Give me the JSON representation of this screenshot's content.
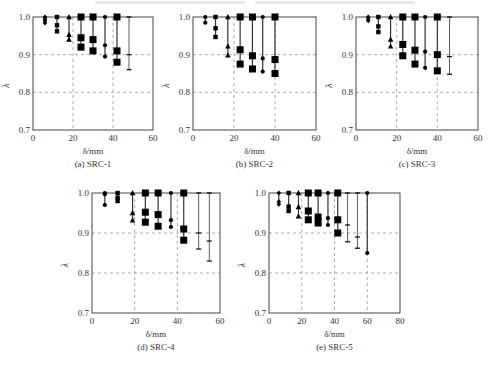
{
  "figure": {
    "top_caption_cut_off": true
  },
  "chart_data": [
    {
      "id": "a",
      "type": "scatter",
      "caption": "(a) SRC-1",
      "xlabel": "δ/mm",
      "ylabel": "λ",
      "xlim": [
        0,
        60
      ],
      "ylim": [
        0.7,
        1.0
      ],
      "xticks": [
        "0",
        "20",
        "40",
        "60"
      ],
      "yticks": [
        "0.7",
        "0.8",
        "0.9",
        "1.0"
      ],
      "grid": "dashed at x=20,40 and y=0.8,0.9",
      "box": {
        "left": 33,
        "top": 17,
        "right": 153,
        "bottom": 130
      },
      "groups": [
        {
          "x": 6,
          "marker": "diamond",
          "values": [
            1.0,
            0.995,
            0.99,
            0.984
          ]
        },
        {
          "x": 12,
          "marker": "small-square",
          "values": [
            1.0,
            0.978,
            0.962
          ]
        },
        {
          "x": 18,
          "marker": "triangle",
          "values": [
            1.0,
            0.953,
            0.94
          ]
        },
        {
          "x": 24,
          "marker": "big-square",
          "values": [
            1.0,
            0.945,
            0.92
          ]
        },
        {
          "x": 30,
          "marker": "big-square",
          "values": [
            1.0,
            0.94,
            0.91
          ]
        },
        {
          "x": 36,
          "marker": "circle",
          "values": [
            1.0,
            0.925,
            0.895
          ]
        },
        {
          "x": 42,
          "marker": "big-square",
          "values": [
            1.0,
            0.91,
            0.88
          ]
        },
        {
          "x": 48,
          "marker": "dash",
          "values": [
            1.0,
            0.9,
            0.86
          ]
        }
      ]
    },
    {
      "id": "b",
      "type": "scatter",
      "caption": "(b) SRC-2",
      "xlabel": "δ/mm",
      "ylabel": "λ",
      "xlim": [
        0,
        60
      ],
      "ylim": [
        0.7,
        1.0
      ],
      "xticks": [
        "0",
        "20",
        "40",
        "60"
      ],
      "yticks": [
        "0.7",
        "0.8",
        "0.9",
        "1.0"
      ],
      "grid": "dashed at x=20,40 and y=0.8,0.9",
      "box": {
        "left": 193,
        "top": 17,
        "right": 316,
        "bottom": 130
      },
      "groups": [
        {
          "x": 6,
          "marker": "circle",
          "values": [
            1.0,
            0.985
          ]
        },
        {
          "x": 11,
          "marker": "small-square",
          "values": [
            1.0,
            0.97,
            0.947
          ]
        },
        {
          "x": 17,
          "marker": "triangle",
          "values": [
            1.0,
            0.922,
            0.898
          ]
        },
        {
          "x": 23,
          "marker": "big-square",
          "values": [
            1.0,
            0.913,
            0.875
          ]
        },
        {
          "x": 29,
          "marker": "big-square",
          "values": [
            1.0,
            0.897,
            0.862
          ]
        },
        {
          "x": 34,
          "marker": "circle",
          "values": [
            1.0,
            0.89,
            0.855
          ]
        },
        {
          "x": 40,
          "marker": "big-square",
          "values": [
            1.0,
            0.887,
            0.85
          ]
        }
      ]
    },
    {
      "id": "c",
      "type": "scatter",
      "caption": "(c) SRC-3",
      "xlabel": "δ/mm",
      "ylabel": "λ",
      "xlim": [
        0,
        60
      ],
      "ylim": [
        0.7,
        1.0
      ],
      "xticks": [
        "0",
        "20",
        "40",
        "60"
      ],
      "yticks": [
        "0.7",
        "0.8",
        "0.9",
        "1.0"
      ],
      "grid": "dashed at x=20,40 and y=0.8,0.9",
      "box": {
        "left": 356,
        "top": 17,
        "right": 478,
        "bottom": 130
      },
      "groups": [
        {
          "x": 6,
          "marker": "diamond",
          "values": [
            1.0,
            0.995,
            0.99
          ]
        },
        {
          "x": 11,
          "marker": "small-square",
          "values": [
            1.0,
            0.975,
            0.96
          ]
        },
        {
          "x": 17,
          "marker": "triangle",
          "values": [
            1.0,
            0.94,
            0.922
          ]
        },
        {
          "x": 23,
          "marker": "big-square",
          "values": [
            1.0,
            0.927,
            0.897
          ]
        },
        {
          "x": 29,
          "marker": "big-square",
          "values": [
            1.0,
            0.912,
            0.875
          ]
        },
        {
          "x": 34,
          "marker": "circle",
          "values": [
            1.0,
            0.908,
            0.865
          ]
        },
        {
          "x": 40,
          "marker": "big-square",
          "values": [
            1.0,
            0.9,
            0.857
          ]
        },
        {
          "x": 46,
          "marker": "dash",
          "values": [
            1.0,
            0.895,
            0.848
          ]
        }
      ]
    },
    {
      "id": "d",
      "type": "scatter",
      "caption": "(d) SRC-4",
      "xlabel": "δ/mm",
      "ylabel": "λ",
      "xlim": [
        0,
        60
      ],
      "ylim": [
        0.7,
        1.0
      ],
      "xticks": [
        "0",
        "20",
        "40",
        "60"
      ],
      "yticks": [
        "0.7",
        "0.8",
        "0.9",
        "1.0"
      ],
      "grid": "dashed at x=20,40 and y=0.8,0.9",
      "box": {
        "left": 92,
        "top": 193,
        "right": 220,
        "bottom": 313
      },
      "groups": [
        {
          "x": 6,
          "marker": "circle",
          "values": [
            1.0,
            0.997,
            0.97
          ]
        },
        {
          "x": 12,
          "marker": "small-square",
          "values": [
            1.0,
            0.988,
            0.98
          ]
        },
        {
          "x": 19,
          "marker": "triangle",
          "values": [
            1.0,
            0.95,
            0.932
          ]
        },
        {
          "x": 25,
          "marker": "big-square",
          "values": [
            1.0,
            0.952,
            0.927
          ]
        },
        {
          "x": 31,
          "marker": "big-square",
          "values": [
            1.0,
            0.946,
            0.917
          ]
        },
        {
          "x": 37,
          "marker": "circle",
          "values": [
            1.0,
            0.932,
            0.915
          ]
        },
        {
          "x": 43,
          "marker": "big-square",
          "values": [
            1.0,
            0.91,
            0.882
          ]
        },
        {
          "x": 50,
          "marker": "dash",
          "values": [
            1.0,
            0.9,
            0.86
          ]
        },
        {
          "x": 55,
          "marker": "dash",
          "values": [
            1.0,
            0.88,
            0.83
          ]
        }
      ]
    },
    {
      "id": "e",
      "type": "scatter",
      "caption": "(e) SRC-5",
      "xlabel": "δ/mm",
      "ylabel": "λ",
      "xlim": [
        0,
        80
      ],
      "ylim": [
        0.7,
        1.0
      ],
      "xticks": [
        "0",
        "20",
        "40",
        "60",
        "80"
      ],
      "yticks": [
        "0.7",
        "0.8",
        "0.9",
        "1.0"
      ],
      "grid": "dashed at x=20,40,60 and y=0.8,0.9",
      "box": {
        "left": 269,
        "top": 193,
        "right": 400,
        "bottom": 313
      },
      "groups": [
        {
          "x": 6,
          "marker": "diamond",
          "values": [
            1.0,
            0.978,
            0.972
          ]
        },
        {
          "x": 12,
          "marker": "small-square",
          "values": [
            1.0,
            0.966,
            0.955
          ]
        },
        {
          "x": 18,
          "marker": "triangle",
          "values": [
            1.0,
            0.965,
            0.942
          ]
        },
        {
          "x": 24,
          "marker": "big-square",
          "values": [
            1.0,
            0.955,
            0.933
          ]
        },
        {
          "x": 30,
          "marker": "big-square",
          "values": [
            1.0,
            0.94,
            0.925
          ]
        },
        {
          "x": 36,
          "marker": "circle",
          "values": [
            1.0,
            0.937,
            0.92
          ]
        },
        {
          "x": 42,
          "marker": "big-square",
          "values": [
            1.0,
            0.933,
            0.9
          ]
        },
        {
          "x": 48,
          "marker": "dash",
          "values": [
            1.0,
            0.92,
            0.878
          ]
        },
        {
          "x": 54,
          "marker": "dash",
          "values": [
            1.0,
            0.89,
            0.862
          ]
        },
        {
          "x": 60,
          "marker": "circle",
          "values": [
            1.0,
            0.85
          ]
        }
      ]
    }
  ]
}
